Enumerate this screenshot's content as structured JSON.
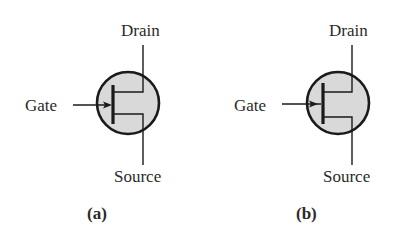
{
  "diagram": {
    "type": "JFET schematic symbols",
    "colors": {
      "stroke": "#1a1a1a",
      "body_fill": "#d9d9d9",
      "text": "#2a2a2a",
      "background": "#ffffff"
    },
    "symbols": [
      {
        "id": "a",
        "caption": "(a)",
        "labels": {
          "drain": "Drain",
          "gate": "Gate",
          "source": "Source"
        },
        "gate_arrow_direction": "right",
        "gate_arrow_position": "inside-circle-at-bar"
      },
      {
        "id": "b",
        "caption": "(b)",
        "labels": {
          "drain": "Drain",
          "gate": "Gate",
          "source": "Source"
        },
        "gate_arrow_direction": "right",
        "gate_arrow_position": "at-circle-edge"
      }
    ]
  }
}
